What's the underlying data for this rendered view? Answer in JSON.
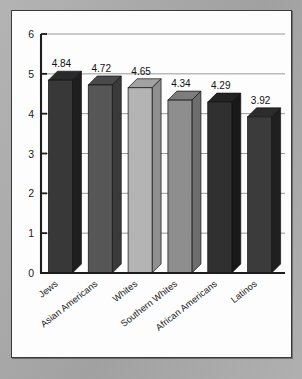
{
  "chart_data": {
    "type": "bar",
    "title": "",
    "subtitle": "",
    "xlabel": "",
    "ylabel": "",
    "ylim": [
      0,
      6
    ],
    "ytick_labels": [
      "0",
      "1",
      "2",
      "3",
      "4",
      "5",
      "6"
    ],
    "ytick_values": [
      0,
      1,
      2,
      3,
      4,
      5,
      6
    ],
    "grid": true,
    "gridlines_at": [
      1,
      2,
      3,
      4,
      5,
      6
    ],
    "legend": false,
    "legend_position": "none",
    "style": "3d-column",
    "categories": [
      "Jews",
      "Asian Americans",
      "Whites",
      "Southern Whites",
      "African Americans",
      "Latinos"
    ],
    "values": [
      4.84,
      4.72,
      4.65,
      4.34,
      4.29,
      3.92
    ],
    "data_labels": [
      "4.84",
      "4.72",
      "4.65",
      "4.34",
      "4.29",
      "3.92"
    ],
    "bar_colors": [
      "#383838",
      "#565656",
      "#b4b4b4",
      "#8e8e8e",
      "#303030",
      "#3b3b3b"
    ],
    "bar_side_colors": [
      "#1e1e1e",
      "#3a3a3a",
      "#8f8f8f",
      "#6d6d6d",
      "#181818",
      "#202020"
    ],
    "bar_top_colors": [
      "#2a2a2a",
      "#4a4a4a",
      "#a2a2a2",
      "#7d7d7d",
      "#232323",
      "#2c2c2c"
    ],
    "category_label_rotation": -38
  },
  "figure": {
    "background_color": "#ababab",
    "panel_color": "#fdfdfd",
    "panel_border_color": "#3a3a3a",
    "axis_color": "#1d1d1d",
    "gridline_color": "#8d8d8d"
  }
}
